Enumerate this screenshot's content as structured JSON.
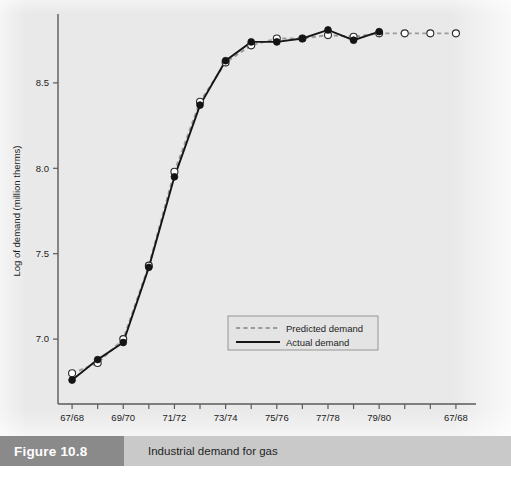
{
  "figure": {
    "tag": "Figure 10.8",
    "caption": "Industrial demand for gas",
    "source_note": ""
  },
  "chart_data": {
    "type": "line",
    "title": "Industrial demand for gas",
    "xlabel": "",
    "ylabel": "Log of demand (million therms)",
    "ylim": [
      6.62,
      8.88
    ],
    "yticks": [
      7.0,
      7.5,
      8.0,
      8.5
    ],
    "ytick_labels": [
      "7.0",
      "7.5",
      "8.0",
      "8.5"
    ],
    "grid": false,
    "legend_position": "center",
    "x_tick_labels": [
      "67/68",
      "",
      "69/70",
      "",
      "71/72",
      "",
      "73/74",
      "",
      "75/76",
      "",
      "77/78",
      "",
      "79/80",
      "",
      "",
      "67/68"
    ],
    "x": [
      "67/68",
      "68/69",
      "69/70",
      "70/71",
      "71/72",
      "72/73",
      "73/74",
      "74/75",
      "75/76",
      "76/77",
      "77/78",
      "78/79",
      "79/80",
      "80/81",
      "81/82",
      "67/68"
    ],
    "series": [
      {
        "name": "Predicted demand",
        "style": "dashed",
        "color": "#9b9b9b",
        "marker": "open-circle",
        "values": [
          6.8,
          6.86,
          7.0,
          7.43,
          7.98,
          8.39,
          8.62,
          8.72,
          8.76,
          8.76,
          8.78,
          8.77,
          8.79,
          8.79,
          8.79,
          8.79
        ]
      },
      {
        "name": "Actual demand",
        "style": "solid",
        "color": "#151515",
        "marker": "filled-circle",
        "values": [
          6.76,
          6.88,
          6.98,
          7.42,
          7.95,
          8.37,
          8.63,
          8.74,
          8.74,
          8.76,
          8.81,
          8.75,
          8.8,
          null,
          null,
          null
        ]
      }
    ],
    "legend": [
      {
        "label": "Predicted demand",
        "style": "dashed",
        "color": "#9b9b9b"
      },
      {
        "label": "Actual demand",
        "style": "solid",
        "color": "#151515"
      }
    ]
  }
}
